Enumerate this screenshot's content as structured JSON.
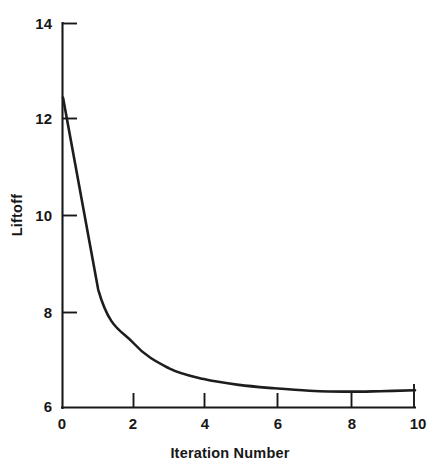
{
  "figure": {
    "background_color": "#ffffff",
    "line_color": "#1d1d1d",
    "axis_color": "#191919",
    "text_color": "#171717"
  },
  "axes": {
    "y_title": "Liftoff",
    "x_title": "Iteration Number",
    "y_ticks": [
      "14",
      "12",
      "10",
      "8",
      "6"
    ],
    "x_ticks": [
      "0",
      "2",
      "4",
      "6",
      "8",
      "10"
    ]
  },
  "chart_data": {
    "type": "line",
    "title": "",
    "subtitle": "",
    "xlabel": "Iteration Number",
    "ylabel": "Liftoff",
    "xlim": [
      0,
      10
    ],
    "ylim": [
      6,
      14
    ],
    "xticks": [
      0,
      2,
      4,
      6,
      8,
      10
    ],
    "yticks": [
      6,
      8,
      10,
      12,
      14
    ],
    "grid": false,
    "legend": null,
    "legend_position": "none",
    "annotations": [],
    "series": [
      {
        "name": "Liftoff",
        "color": "#1d1d1d",
        "x": [
          0,
          1,
          2,
          3,
          4,
          5,
          6,
          7,
          8,
          9,
          10
        ],
        "values": [
          12.45,
          8.46,
          7.35,
          6.83,
          6.6,
          6.48,
          6.41,
          6.36,
          6.34,
          6.35,
          6.37
        ]
      }
    ]
  }
}
